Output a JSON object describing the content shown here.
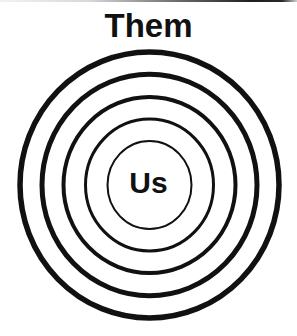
{
  "diagram": {
    "type": "concentric-circles",
    "outer_label": "Them",
    "inner_label": "Us",
    "center": {
      "x": 149.5,
      "y": 185
    },
    "rings": [
      {
        "rx": 129.5,
        "ry": 133,
        "stroke_width": 5.5
      },
      {
        "rx": 107.5,
        "ry": 110.75,
        "stroke_width": 5
      },
      {
        "rx": 86,
        "ry": 88,
        "stroke_width": 4
      },
      {
        "rx": 64,
        "ry": 66,
        "stroke_width": 3
      },
      {
        "rx": 42,
        "ry": 44,
        "stroke_width": 2
      }
    ],
    "stroke_color": "#111111",
    "background_color": "#ffffff"
  }
}
